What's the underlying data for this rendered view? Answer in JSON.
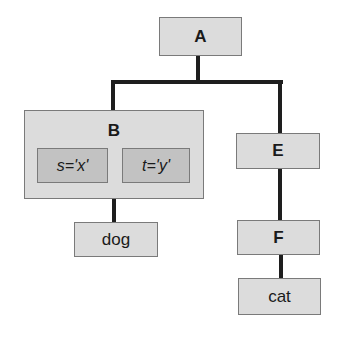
{
  "diagram": {
    "type": "tree",
    "nodes": {
      "a": {
        "label": "A"
      },
      "b": {
        "label": "B",
        "attributes": [
          {
            "label": "s='x'"
          },
          {
            "label": "t='y'"
          }
        ]
      },
      "dog": {
        "label": "dog"
      },
      "e": {
        "label": "E"
      },
      "f": {
        "label": "F"
      },
      "cat": {
        "label": "cat"
      }
    },
    "edges": [
      {
        "from": "A",
        "to": "B"
      },
      {
        "from": "A",
        "to": "E"
      },
      {
        "from": "B",
        "to": "dog"
      },
      {
        "from": "E",
        "to": "F"
      },
      {
        "from": "F",
        "to": "cat"
      }
    ],
    "colors": {
      "node_fill": "#dcdcdc",
      "attribute_fill": "#c2c2c2",
      "border": "#7a7a7a",
      "edge": "#1e1e1e"
    }
  }
}
